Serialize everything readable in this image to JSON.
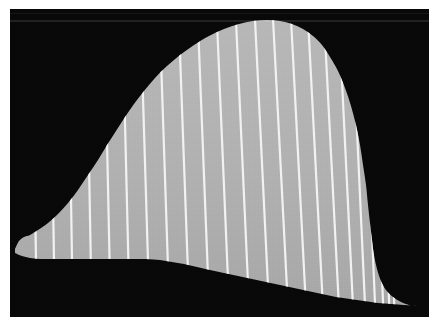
{
  "figure": {
    "title": "",
    "caption": "",
    "kind": "grayscale-profile-image",
    "width_px": 440,
    "height_px": 333,
    "background_color": "#ffffff",
    "frame": {
      "x": 10,
      "y": 9,
      "width": 419,
      "height": 308,
      "fill_color": "#080808"
    }
  },
  "chart_data": {
    "type": "area",
    "title": "",
    "subtitle": "",
    "xlabel": "",
    "ylabel": "",
    "grid": false,
    "legend": null,
    "xlim": [
      0,
      419
    ],
    "ylim": [
      0,
      308
    ],
    "colors": {
      "background": "#080808",
      "band_fill": "#b2b2b2",
      "band_fill_dark": "#a3a3a3",
      "striation": "#f2f2f2",
      "page": "#ffffff"
    },
    "series": [
      {
        "name": "upper boundary",
        "role": "top_edge_of_band",
        "points": [
          [
            5,
            240
          ],
          [
            9,
            232
          ],
          [
            14,
            228
          ],
          [
            20,
            226
          ],
          [
            28,
            221
          ],
          [
            38,
            214
          ],
          [
            48,
            205
          ],
          [
            58,
            194
          ],
          [
            68,
            181
          ],
          [
            78,
            166
          ],
          [
            88,
            151
          ],
          [
            97,
            136
          ],
          [
            106,
            122
          ],
          [
            115,
            108
          ],
          [
            124,
            95
          ],
          [
            134,
            82
          ],
          [
            145,
            69
          ],
          [
            157,
            57
          ],
          [
            170,
            46
          ],
          [
            184,
            36
          ],
          [
            199,
            27
          ],
          [
            214,
            20
          ],
          [
            229,
            15
          ],
          [
            243,
            12
          ],
          [
            257,
            11
          ],
          [
            270,
            12
          ],
          [
            282,
            15
          ],
          [
            293,
            20
          ],
          [
            303,
            27
          ],
          [
            312,
            36
          ],
          [
            320,
            48
          ],
          [
            328,
            62
          ],
          [
            335,
            79
          ],
          [
            341,
            97
          ],
          [
            346,
            116
          ],
          [
            350,
            136
          ],
          [
            353,
            156
          ],
          [
            356,
            176
          ],
          [
            358,
            196
          ],
          [
            360,
            214
          ],
          [
            362,
            231
          ],
          [
            364,
            246
          ],
          [
            367,
            260
          ],
          [
            371,
            272
          ],
          [
            376,
            281
          ],
          [
            383,
            288
          ],
          [
            391,
            293
          ],
          [
            399,
            296
          ],
          [
            406,
            297
          ]
        ]
      },
      {
        "name": "lower boundary",
        "role": "bottom_edge_of_band",
        "points": [
          [
            5,
            244
          ],
          [
            12,
            247
          ],
          [
            20,
            249
          ],
          [
            30,
            250
          ],
          [
            45,
            250
          ],
          [
            62,
            250
          ],
          [
            80,
            250
          ],
          [
            100,
            250
          ],
          [
            118,
            250
          ],
          [
            136,
            250
          ],
          [
            150,
            251
          ],
          [
            162,
            253
          ],
          [
            174,
            255
          ],
          [
            187,
            258
          ],
          [
            200,
            261
          ],
          [
            214,
            264
          ],
          [
            228,
            267
          ],
          [
            242,
            270
          ],
          [
            256,
            273
          ],
          [
            270,
            276
          ],
          [
            284,
            279
          ],
          [
            298,
            282
          ],
          [
            312,
            285
          ],
          [
            326,
            288
          ],
          [
            340,
            290
          ],
          [
            354,
            292
          ],
          [
            368,
            294
          ],
          [
            382,
            295
          ],
          [
            394,
            296
          ],
          [
            406,
            297
          ]
        ]
      }
    ],
    "striations": {
      "count": 23,
      "color": "#f2f2f2",
      "line_width_px": 2.2,
      "description": "Near-vertical white lines crossing the band, fanning so that lower ends are shifted progressively right of upper ends.",
      "top_x": [
        22,
        40,
        58,
        76,
        94,
        112,
        130,
        149,
        168,
        187,
        206,
        225,
        244,
        262,
        280,
        297,
        313,
        328,
        341,
        352,
        361,
        368,
        374
      ],
      "bottom_x": [
        27,
        45,
        63,
        82,
        101,
        120,
        140,
        160,
        180,
        200,
        220,
        240,
        260,
        279,
        297,
        314,
        330,
        344,
        356,
        366,
        374,
        380,
        385
      ]
    }
  }
}
